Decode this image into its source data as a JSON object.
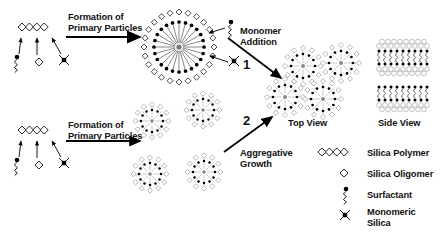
{
  "figure": {
    "background_color": "#ffffff",
    "ink_color": "#000000",
    "shell_color": "#b8b8b8"
  },
  "reactions": [
    {
      "id": "top",
      "label_line1": "Formation of",
      "label_line2": "Primary Particles"
    },
    {
      "id": "bottom",
      "label_line1": "Formation of",
      "label_line2": "Primary Particles"
    }
  ],
  "pathways": [
    {
      "number": "1",
      "label_line1": "Monomer",
      "label_line2": "Addition"
    },
    {
      "number": "2",
      "label_line1": "Aggregative",
      "label_line2": "Growth"
    }
  ],
  "views": [
    {
      "id": "top-view",
      "label": "Top View"
    },
    {
      "id": "side-view",
      "label": "Side View"
    }
  ],
  "legend": {
    "items": [
      {
        "glyph": "silica-polymer-icon",
        "label": "Silica Polymer"
      },
      {
        "glyph": "silica-oligomer-icon",
        "label": "Silica Oligomer"
      },
      {
        "glyph": "surfactant-icon",
        "label": "Surfactant"
      },
      {
        "glyph": "monomeric-silica-icon",
        "label_line1": "Monomeric",
        "label_line2": "Silica"
      }
    ]
  }
}
